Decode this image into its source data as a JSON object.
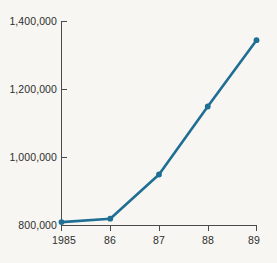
{
  "chart_data": {
    "type": "line",
    "title": "",
    "subtitle": "",
    "xlabel": "",
    "ylabel": "",
    "categories": [
      "1985",
      "86",
      "87",
      "88",
      "89"
    ],
    "x_tick_labels": [
      "1985",
      "86",
      "87",
      "88",
      "89"
    ],
    "y_tick_labels": [
      "800,000",
      "1,000,000",
      "1,200,000",
      "1,400,000"
    ],
    "y_tick_values": [
      800000,
      1000000,
      1200000,
      1400000
    ],
    "ylim": [
      800000,
      1400000
    ],
    "xlim": [
      "1985",
      "89"
    ],
    "grid": false,
    "legend": null,
    "legend_position": "none",
    "annotations": [],
    "series": [
      {
        "name": "series-1",
        "values": [
          810000,
          820000,
          950000,
          1150000,
          1345000
        ],
        "color": "#1f6e94",
        "marker": "circle",
        "line_width": 2.6
      }
    ]
  },
  "style": {
    "background_color": "#f7f6f2",
    "axis_color": "#4a4a4a",
    "tick_label_color": "#2e2e2e",
    "series_color": "#1f6e94"
  }
}
